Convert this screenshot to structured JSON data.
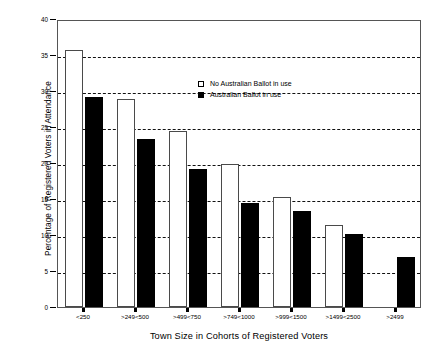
{
  "chart_data": {
    "type": "bar",
    "title": "",
    "xlabel": "Town Size in Cohorts of Registered Voters",
    "ylabel": "Percentage of Registered Voters in Attendance",
    "categories": [
      "<250",
      ">249<500",
      ">499<750",
      ">749<1000",
      ">999<1500",
      ">1499<2500",
      ">2499"
    ],
    "series": [
      {
        "name": "No Australian Ballot in use",
        "color": "#ffffff",
        "edge_color": "#4a4a4a",
        "values": [
          35.7,
          28.9,
          24.4,
          19.8,
          15.3,
          11.4,
          null
        ]
      },
      {
        "name": "Australian Ballot in use",
        "color": "#000000",
        "edge_color": "#000000",
        "values": [
          29.1,
          23.4,
          19.2,
          14.5,
          13.3,
          10.2,
          7.0
        ]
      }
    ],
    "ylim": [
      0,
      40
    ],
    "yticks": [
      0,
      5,
      10,
      15,
      20,
      25,
      30,
      35,
      40
    ],
    "ytick_labels": [
      "0",
      "5",
      "10",
      "15",
      "20",
      "25",
      "30",
      "35",
      "40"
    ],
    "grid": true,
    "grid_axis": "y",
    "grid_style": "dashed",
    "legend_position": "upper right inside"
  },
  "legend": {
    "entries": [
      {
        "label": "No Australian Ballot in use",
        "swatch": "white-square-icon"
      },
      {
        "label": "Australian Ballot in use",
        "swatch": "black-square-icon"
      }
    ]
  }
}
